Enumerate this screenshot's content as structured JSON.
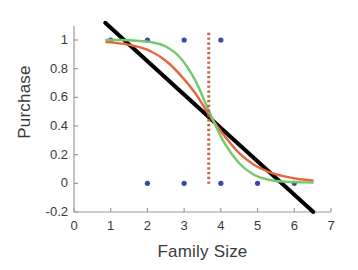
{
  "chart_data": {
    "type": "scatter",
    "title": "",
    "xlabel": "Family Size",
    "ylabel": "Purchase",
    "xlim": [
      0,
      7
    ],
    "ylim": [
      -0.2,
      1.1
    ],
    "xticks": [
      "0",
      "1",
      "2",
      "3",
      "4",
      "5",
      "6",
      "7"
    ],
    "xtick_values": [
      0,
      1,
      2,
      3,
      4,
      5,
      6,
      7
    ],
    "yticks": [
      "1",
      "0.8",
      "0.6",
      "0.4",
      "0.2",
      "0",
      "-0.2"
    ],
    "ytick_values": [
      1,
      0.8,
      0.6,
      0.4,
      0.2,
      0,
      -0.2
    ],
    "grid": false,
    "legend": "none",
    "series": [
      {
        "name": "observed-data",
        "type": "scatter",
        "marker": "dot",
        "color": "#3b46a8",
        "points": [
          {
            "x": 1.0,
            "y": 1
          },
          {
            "x": 2.0,
            "y": 1
          },
          {
            "x": 3.0,
            "y": 1
          },
          {
            "x": 4.0,
            "y": 1
          },
          {
            "x": 2.0,
            "y": 0
          },
          {
            "x": 3.0,
            "y": 0
          },
          {
            "x": 4.0,
            "y": 0
          },
          {
            "x": 5.0,
            "y": 0
          },
          {
            "x": 6.0,
            "y": 0
          }
        ]
      },
      {
        "name": "linear-fit",
        "type": "line",
        "color": "#000000",
        "width": 4,
        "points": [
          {
            "x": 0.85,
            "y": 1.12
          },
          {
            "x": 6.52,
            "y": -0.2
          }
        ]
      },
      {
        "name": "logistic-fit",
        "type": "line",
        "color": "#e8663c",
        "width": 2.4,
        "points": [
          {
            "x": 0.88,
            "y": 0.985
          },
          {
            "x": 1.3,
            "y": 0.975
          },
          {
            "x": 1.7,
            "y": 0.955
          },
          {
            "x": 2.1,
            "y": 0.92
          },
          {
            "x": 2.5,
            "y": 0.855
          },
          {
            "x": 2.9,
            "y": 0.755
          },
          {
            "x": 3.3,
            "y": 0.63
          },
          {
            "x": 3.7,
            "y": 0.47
          },
          {
            "x": 4.1,
            "y": 0.33
          },
          {
            "x": 4.5,
            "y": 0.21
          },
          {
            "x": 4.9,
            "y": 0.13
          },
          {
            "x": 5.3,
            "y": 0.08
          },
          {
            "x": 5.7,
            "y": 0.05
          },
          {
            "x": 6.1,
            "y": 0.03
          },
          {
            "x": 6.5,
            "y": 0.02
          }
        ]
      },
      {
        "name": "probit-fit",
        "type": "line",
        "color": "#72c86a",
        "width": 2.4,
        "points": [
          {
            "x": 0.88,
            "y": 1.0
          },
          {
            "x": 1.3,
            "y": 1.0
          },
          {
            "x": 1.7,
            "y": 0.995
          },
          {
            "x": 2.1,
            "y": 0.985
          },
          {
            "x": 2.5,
            "y": 0.955
          },
          {
            "x": 2.9,
            "y": 0.875
          },
          {
            "x": 3.3,
            "y": 0.72
          },
          {
            "x": 3.7,
            "y": 0.49
          },
          {
            "x": 4.1,
            "y": 0.28
          },
          {
            "x": 4.5,
            "y": 0.14
          },
          {
            "x": 4.9,
            "y": 0.06
          },
          {
            "x": 5.3,
            "y": 0.025
          },
          {
            "x": 5.7,
            "y": 0.012
          },
          {
            "x": 6.1,
            "y": 0.008
          },
          {
            "x": 6.5,
            "y": 0.005
          }
        ]
      },
      {
        "name": "threshold-line",
        "type": "vline",
        "style": "dotted",
        "color": "#c4603a",
        "x": 3.67,
        "y_from": -0.02,
        "y_to": 1.05
      }
    ]
  },
  "axes": {
    "axis_color": "#9a9a9a",
    "label_color": "#3a3a3a"
  }
}
